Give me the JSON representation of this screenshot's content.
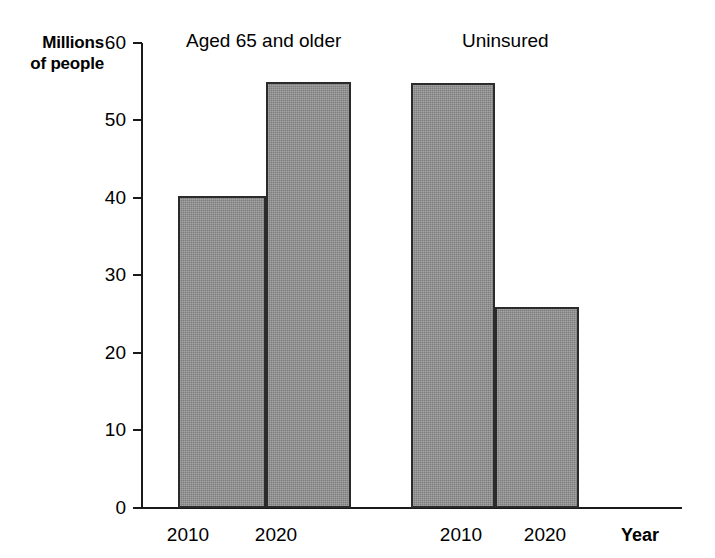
{
  "chart_data": {
    "type": "bar",
    "title": "",
    "subtitle": "",
    "ylabel": "Millions\nof people",
    "ylabel_line1": "Millions",
    "ylabel_line2": "of people",
    "xlabel": "Year",
    "ylim": [
      0,
      60
    ],
    "yticks": [
      0,
      10,
      20,
      30,
      40,
      50,
      60
    ],
    "ytick_labels": [
      "0",
      "10",
      "20",
      "30",
      "40",
      "50",
      "60"
    ],
    "grid": false,
    "legend": "none",
    "categories": [
      "2010",
      "2020",
      "2010",
      "2020"
    ],
    "groups": [
      {
        "name": "Aged 65 and older",
        "categories": [
          "2010",
          "2020"
        ],
        "values": [
          40.3,
          55.0
        ]
      },
      {
        "name": "Uninsured",
        "categories": [
          "2010",
          "2020"
        ],
        "values": [
          54.8,
          26.0
        ]
      }
    ],
    "bars": [
      {
        "group": "Aged 65 and older",
        "year": "2010",
        "value": 40.3
      },
      {
        "group": "Aged 65 and older",
        "year": "2020",
        "value": 55.0
      },
      {
        "group": "Uninsured",
        "year": "2010",
        "value": 54.8
      },
      {
        "group": "Uninsured",
        "year": "2020",
        "value": 26.0
      }
    ],
    "values": [
      40.3,
      55.0,
      54.8,
      26.0
    ],
    "annotations": [],
    "colors": {
      "bar_fill": "#8e8e8e",
      "bar_stroke": "#2b2b2b",
      "axis": "#1a1a1a",
      "text": "#000000",
      "background": "#ffffff"
    }
  },
  "axis": {
    "y_label_line1": "Millions",
    "y_label_line2": "of people",
    "x_label": "Year",
    "ticks": {
      "t60": "60",
      "t50": "50",
      "t40": "40",
      "t30": "30",
      "t20": "20",
      "t10": "10",
      "t0": "0"
    }
  },
  "groups": {
    "left_label": "Aged 65 and older",
    "right_label": "Uninsured"
  },
  "xticks": {
    "bar1": "2010",
    "bar2": "2020",
    "bar3": "2010",
    "bar4": "2020"
  }
}
